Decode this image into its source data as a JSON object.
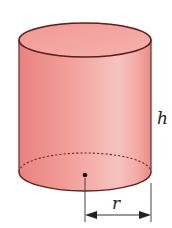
{
  "figure": {
    "shape": "cylinder",
    "labels": {
      "height": "h",
      "radius": "r"
    },
    "colors": {
      "fill_light": "#f6c4c0",
      "fill_mid": "#ee9c97",
      "fill_dark": "#e07f7a",
      "outline": "#5a1f1c",
      "dimension_line": "#333333"
    }
  }
}
